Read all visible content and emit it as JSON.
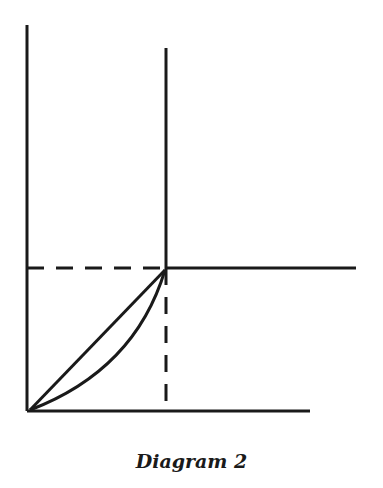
{
  "caption": "Diagram 2",
  "colors": {
    "stroke": "#1a1a1a",
    "background": "#ffffff"
  },
  "diagram": {
    "lines": [
      {
        "name": "left-vertical-axis",
        "x1": 27,
        "y1": 25,
        "x2": 27,
        "y2": 411,
        "style": "solid"
      },
      {
        "name": "bottom-horizontal-axis",
        "x1": 27,
        "y1": 411,
        "x2": 310,
        "y2": 411,
        "style": "solid"
      },
      {
        "name": "upper-vertical-line",
        "x1": 166,
        "y1": 48,
        "x2": 166,
        "y2": 268,
        "style": "solid"
      },
      {
        "name": "right-horizontal-line",
        "x1": 166,
        "y1": 268,
        "x2": 356,
        "y2": 268,
        "style": "solid"
      },
      {
        "name": "dashed-horizontal-guide",
        "x1": 27,
        "y1": 268,
        "x2": 166,
        "y2": 268,
        "style": "dashed"
      },
      {
        "name": "dashed-vertical-guide",
        "x1": 166,
        "y1": 268,
        "x2": 166,
        "y2": 411,
        "style": "dashed"
      },
      {
        "name": "diagonal-straight-line",
        "x1": 30,
        "y1": 410,
        "x2": 165,
        "y2": 270,
        "style": "solid"
      }
    ],
    "curve": {
      "name": "convex-curve",
      "from": [
        30,
        410
      ],
      "control": [
        135,
        370
      ],
      "to": [
        165,
        270
      ]
    }
  }
}
